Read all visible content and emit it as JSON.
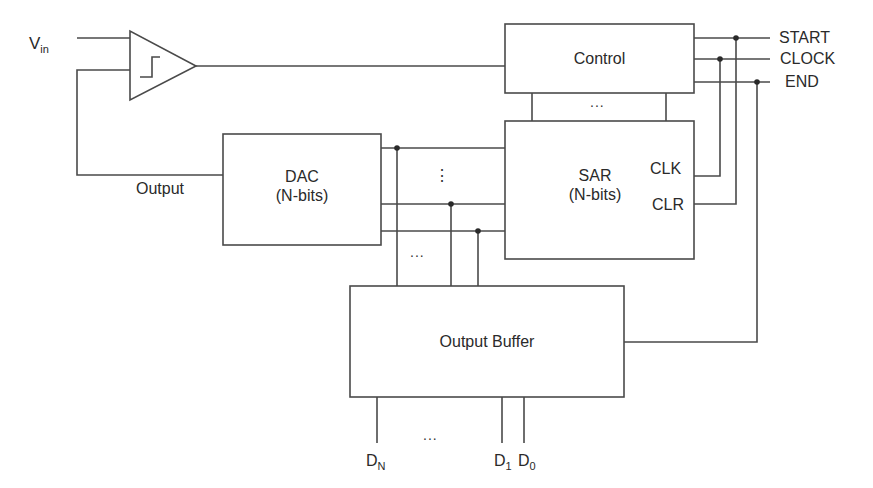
{
  "diagram": {
    "colors": {
      "line": "#4a4a4a",
      "text": "#2a2a2a",
      "background": "#ffffff"
    },
    "inputs": {
      "vin": {
        "main": "V",
        "sub": "in"
      }
    },
    "comparator": {
      "icon": "comparator-step-icon"
    },
    "blocks": {
      "control": {
        "label": "Control"
      },
      "sar": {
        "line1": "SAR",
        "line2": "(N-bits)",
        "pin_clk": "CLK",
        "pin_clr": "CLR"
      },
      "dac": {
        "line1": "DAC",
        "line2": "(N-bits)"
      },
      "output_buffer": {
        "label": "Output Buffer"
      }
    },
    "wire_labels": {
      "output": "Output"
    },
    "signals": [
      "START",
      "CLOCK",
      "END"
    ],
    "ellipsis": {
      "horizontal": "...",
      "vertical": "⋮"
    },
    "outputs": [
      {
        "main": "D",
        "sub": "N"
      },
      {
        "main": "D",
        "sub": "1"
      },
      {
        "main": "D",
        "sub": "0"
      }
    ]
  }
}
